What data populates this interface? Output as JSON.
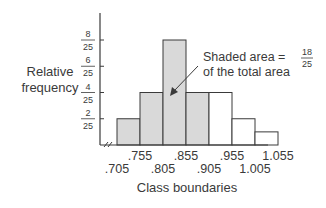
{
  "chart_data": {
    "type": "bar",
    "title": "",
    "xlabel": "Class boundaries",
    "ylabel": "Relative frequency",
    "ylabel_lines": [
      "Relative",
      "frequency"
    ],
    "boundaries": [
      ".705",
      ".755",
      ".805",
      ".855",
      ".905",
      ".955",
      "1.005",
      "1.055"
    ],
    "boundary_values": [
      0.705,
      0.755,
      0.805,
      0.855,
      0.905,
      0.955,
      1.005,
      1.055
    ],
    "categories": [
      ".705-.755",
      ".755-.805",
      ".805-.855",
      ".855-.905",
      ".905-.955",
      ".955-1.005",
      "1.005-1.055"
    ],
    "values": [
      0.08,
      0.16,
      0.32,
      0.16,
      0.16,
      0.08,
      0.04
    ],
    "value_fractions": [
      "2/25",
      "4/25",
      "8/25",
      "4/25",
      "4/25",
      "2/25",
      "1/25"
    ],
    "shaded": [
      true,
      true,
      true,
      true,
      false,
      false,
      false
    ],
    "y_ticks": [
      {
        "value": 0.08,
        "num": "2",
        "den": "25"
      },
      {
        "value": 0.16,
        "num": "4",
        "den": "25"
      },
      {
        "value": 0.24,
        "num": "6",
        "den": "25"
      },
      {
        "value": 0.32,
        "num": "8",
        "den": "25"
      }
    ],
    "ylim": [
      0,
      0.36
    ],
    "grid": false,
    "annotation": {
      "text_line1": "Shaded area =",
      "text_line2": "of the total area",
      "fraction_num": "18",
      "fraction_den": "25"
    },
    "axis_break": true,
    "colors": {
      "shaded": "#d9d9d9",
      "unshaded": "#ffffff",
      "stroke": "#3a3a3a"
    }
  }
}
